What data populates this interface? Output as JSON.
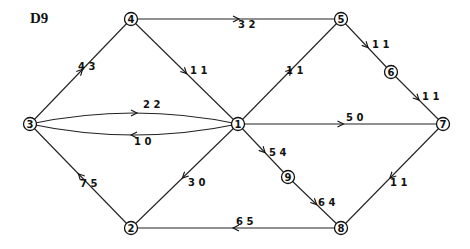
{
  "title": "D9",
  "nodes": [
    {
      "id": "1",
      "x": 238,
      "y": 124
    },
    {
      "id": "2",
      "x": 131,
      "y": 228
    },
    {
      "id": "3",
      "x": 30,
      "y": 124
    },
    {
      "id": "4",
      "x": 131,
      "y": 19
    },
    {
      "id": "5",
      "x": 341,
      "y": 19
    },
    {
      "id": "6",
      "x": 391,
      "y": 72
    },
    {
      "id": "7",
      "x": 443,
      "y": 124
    },
    {
      "id": "8",
      "x": 341,
      "y": 228
    },
    {
      "id": "9",
      "x": 288,
      "y": 177
    }
  ],
  "edges": [
    {
      "from": "3",
      "to": "4",
      "label_a": "4",
      "label_b": "3",
      "lx": 78,
      "ly": 70
    },
    {
      "from": "4",
      "to": "5",
      "label_a": "3",
      "label_b": "2",
      "lx": 238,
      "ly": 28
    },
    {
      "from": "4",
      "to": "1",
      "label_a": "1",
      "label_b": "1",
      "lx": 190,
      "ly": 74
    },
    {
      "from": "1",
      "to": "5",
      "label_a": "1",
      "label_b": "1",
      "lx": 286,
      "ly": 74
    },
    {
      "from": "5",
      "to": "6",
      "label_a": "1",
      "label_b": "1",
      "lx": 372,
      "ly": 48
    },
    {
      "from": "6",
      "to": "7",
      "label_a": "1",
      "label_b": "1",
      "lx": 422,
      "ly": 100
    },
    {
      "from": "3",
      "to": "1",
      "label_a": "2",
      "label_b": "2",
      "lx": 143,
      "ly": 108,
      "curve": "up"
    },
    {
      "from": "1",
      "to": "3",
      "label_a": "1",
      "label_b": "0",
      "lx": 134,
      "ly": 145,
      "curve": "down"
    },
    {
      "from": "1",
      "to": "7",
      "label_a": "5",
      "label_b": "0",
      "lx": 346,
      "ly": 121
    },
    {
      "from": "1",
      "to": "9",
      "label_a": "5",
      "label_b": "4",
      "lx": 269,
      "ly": 156
    },
    {
      "from": "9",
      "to": "8",
      "label_a": "6",
      "label_b": "4",
      "lx": 318,
      "ly": 206
    },
    {
      "from": "7",
      "to": "8",
      "label_a": "1",
      "label_b": "1",
      "lx": 390,
      "ly": 186
    },
    {
      "from": "8",
      "to": "2",
      "label_a": "6",
      "label_b": "5",
      "lx": 236,
      "ly": 225
    },
    {
      "from": "1",
      "to": "2",
      "label_a": "3",
      "label_b": "0",
      "lx": 188,
      "ly": 186
    },
    {
      "from": "2",
      "to": "3",
      "label_a": "7",
      "label_b": "5",
      "lx": 80,
      "ly": 187
    }
  ]
}
